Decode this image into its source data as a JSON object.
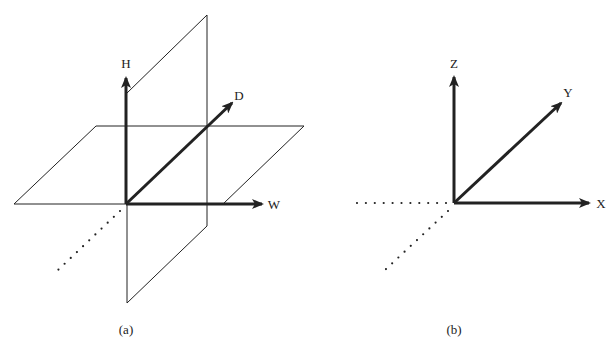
{
  "figure_a": {
    "caption": "(a)",
    "axes": {
      "vertical": "H",
      "depth": "D",
      "horizontal": "W"
    },
    "planes": [
      "horizontal-plane",
      "vertical-plane"
    ]
  },
  "figure_b": {
    "caption": "(b)",
    "axes": {
      "vertical": "Z",
      "depth": "Y",
      "horizontal": "X"
    }
  },
  "colors": {
    "line": "#222222",
    "background": "#ffffff"
  }
}
